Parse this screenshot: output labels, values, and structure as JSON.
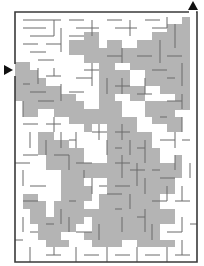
{
  "maze": {
    "size": {
      "width": 204,
      "height": 266
    },
    "colors": {
      "background": "#ffffff",
      "wall": "#3a3a3a",
      "shade": "#b4b4b4",
      "arrow": "#111111",
      "inner_wall": "#6a6a6a"
    },
    "border": {
      "x": 15,
      "y": 12,
      "w": 182,
      "h": 250
    },
    "entry": {
      "side": "left",
      "y": 70,
      "gap": [
        64,
        76
      ],
      "arrow_icon": "arrow-right-icon"
    },
    "exit": {
      "side": "top",
      "x": 193,
      "gap": [
        189,
        196
      ],
      "arrow_icon": "arrow-up-icon"
    },
    "grid": {
      "cols": 24,
      "rows": 33,
      "cell": 7.6
    },
    "shaded_regions": [
      "M15,62 L30,62 L30,70 L38,70 L38,78 L46,78 L46,86 L61,86 L61,94 L76,94 L76,101 L84,101 L84,109 L99,109 L99,117 L92,117 L92,132 L84,132 L84,124 L69,124 L69,117 L54,117 L54,109 L38,109 L38,117 L23,117 L23,101 L15,101 Z",
      "M69,40 L84,40 L84,32 L99,32 L99,48 L107,48 L107,40 L122,40 L122,48 L137,48 L137,40 L152,40 L152,32 L167,32 L167,24 L182,24 L182,17 L190,17 L190,110 L175,110 L175,94 L160,94 L160,86 L145,86 L145,70 L130,70 L130,63 L115,63 L115,70 L99,70 L99,63 L84,63 L84,55 L69,55 Z",
      "M99,70 L130,70 L130,86 L145,86 L145,101 L130,101 L130,94 L115,94 L115,101 L107,101 L107,124 L92,124 L92,117 L99,117 Z",
      "M107,101 L122,101 L122,117 L137,117 L137,132 L152,132 L152,148 L160,148 L160,163 L175,163 L175,155 L182,155 L182,178 L175,178 L175,194 L160,194 L160,209 L175,209 L175,224 L160,224 L160,240 L175,240 L175,247 L137,247 L137,240 L122,240 L122,232 L107,232 L107,224 L92,224 L92,217 L84,217 L84,209 L99,209 L99,194 L107,194 L107,178 L99,178 L99,163 L107,163 Z",
      "M145,101 L175,101 L175,117 L182,117 L182,132 L167,132 L167,124 L152,124 L152,117 L145,117 Z",
      "M38,132 L54,132 L54,140 L69,140 L69,148 L84,148 L84,163 L99,163 L99,178 L84,178 L84,186 L92,186 L92,201 L76,201 L76,186 L61,186 L61,170 L46,170 L46,155 L38,155 Z",
      "M61,186 L76,186 L76,201 L84,201 L84,224 L76,224 L76,232 L61,232 L61,240 L69,240 L69,247 L46,247 L46,240 L38,240 L38,224 L30,224 L30,209 L46,209 L46,217 L54,217 L54,201 L61,201 Z",
      "M92,217 L107,217 L107,232 L122,232 L122,247 L92,247 L92,240 L84,240 L84,232 L92,232 Z",
      "M30,209 L23,209 L23,194 L38,194 L38,201 L46,201 L46,209 Z"
    ],
    "walls": [
      "M23,20 H61 M23,28 H46 M30,36 H54 M23,44 H38 M46,44 H61 M30,52 H46 M38,60 H54",
      "M69,20 H84 M76,28 H99 M61,28 V52 M69,36 H84 M54,20 V36 M92,20 V36 M107,20 H122 M115,28 H137 M130,20 V36 M145,20 H160 M152,28 H167 M167,17 V28 M175,24 V48",
      "M38,68 V84 M46,76 H61 M54,68 V76 M23,84 H30 M30,92 H46 M61,84 V101 M69,92 H84 M23,101 V117 M38,101 H54",
      "M107,56 H122 M122,48 V63 M137,56 H152 M160,40 V63 M167,56 H182 M152,70 H167 M182,63 V86 M167,78 H175 M145,78 V94",
      "M84,70 H99 M92,63 V86 M76,78 H92 M107,78 V94 M115,86 H130 M122,78 V94 M137,94 H152",
      "M23,124 H38 M30,132 V148 M23,155 H38 M15,163 H30 M23,170 V186 M30,186 H46 M23,201 H38",
      "M46,124 H61 M54,117 V132 M61,132 V148 M69,140 H76 M76,132 V148 M46,140 V155 M54,155 H69 M69,155 V170 M76,163 H92 M84,170 V178",
      "M92,132 H107 M99,124 V140 M107,140 V155 M115,132 H130 M122,124 V140 M130,140 V155 M115,148 H122 M137,148 H145 M145,140 V163 M160,140 H175 M175,132 V148",
      "M115,163 H130 M122,155 V178 M130,170 H145 M137,163 V186 M152,170 H160 M145,178 V194 M115,186 H130 M107,194 H122 M130,194 V209 M152,201 H167 M182,186 V201 M175,201 H190",
      "M92,178 V194 M99,186 H107 M69,201 H76 M61,209 V224 M46,224 H54 M69,217 V232 M76,232 H92 M99,224 V240 M115,209 H122 M122,217 V232 M137,217 H145 M145,209 V232 M152,224 V240 M167,232 H182 M182,217 V232",
      "M23,217 V232 M30,232 H38 M15,240 H23 M30,247 V262 M46,255 H61 M54,247 V255 M76,247 V262 M84,255 H99 M107,247 V262 M115,255 H130 M137,247 V262 M145,255 H160 M167,247 V262 M175,255 H190 M182,240 V255 M190,224 H197",
      "M167,101 H182 M182,94 V109 M160,117 H167 M182,140 H190 M175,155 V170 M190,163 V178 M182,117 V132 M167,186 V201 M160,178 H175"
    ]
  }
}
